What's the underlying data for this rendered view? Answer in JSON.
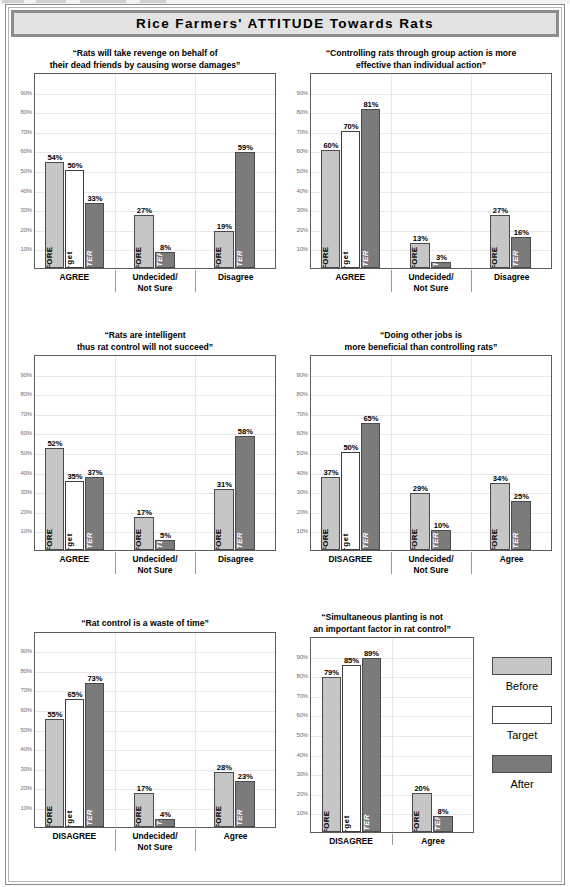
{
  "banner": {
    "title": "Rice Farmers' ATTITUDE Towards Rats"
  },
  "legend": {
    "items": [
      {
        "key": "before",
        "label": "Before",
        "color": "#c6c6c6"
      },
      {
        "key": "target",
        "label": "Target",
        "color": "#ffffff"
      },
      {
        "key": "after",
        "label": "After",
        "color": "#7b7b7b"
      }
    ]
  },
  "axis": {
    "ticks": [
      "90%",
      "80%",
      "70%",
      "60%",
      "50%",
      "40%",
      "30%",
      "20%",
      "10%"
    ],
    "ylim": [
      0,
      100
    ]
  },
  "series_inner_labels": {
    "before": "BEFORE",
    "target": "target",
    "after": "AFTER"
  },
  "chart_data": [
    {
      "id": "chart-1",
      "type": "bar",
      "title": "“Rats will take revenge on behalf of\nthier dead friends by causing worse damages”",
      "title_lines": [
        "“Rats will take revenge on behalf of",
        "their dead friends by causing worse damages”"
      ],
      "categories": [
        "AGREE",
        "Undecided/\nNot Sure",
        "Disagree"
      ],
      "category_lines": [
        [
          "AGREE"
        ],
        [
          "Undecided/",
          "Not Sure"
        ],
        [
          "Disagree"
        ]
      ],
      "series": [
        {
          "name": "Before",
          "values": [
            54,
            27,
            19
          ]
        },
        {
          "name": "Target",
          "values": [
            50,
            null,
            null
          ]
        },
        {
          "name": "After",
          "values": [
            33,
            8,
            59
          ]
        }
      ],
      "ylabel": "",
      "xlabel": "",
      "ylim": [
        0,
        100
      ],
      "grid": true,
      "legend_position": "external-right"
    },
    {
      "id": "chart-2",
      "type": "bar",
      "title_lines": [
        "“Controlling rats through group action is more",
        "effective than individual action”"
      ],
      "categories": [
        "AGREE",
        "Undecided/\nNot Sure",
        "Disagree"
      ],
      "category_lines": [
        [
          "AGREE"
        ],
        [
          "Undecided/",
          "Not Sure"
        ],
        [
          "Disagree"
        ]
      ],
      "series": [
        {
          "name": "Before",
          "values": [
            60,
            13,
            27
          ]
        },
        {
          "name": "Target",
          "values": [
            70,
            null,
            null
          ]
        },
        {
          "name": "After",
          "values": [
            81,
            3,
            16
          ]
        }
      ],
      "ylabel": "",
      "xlabel": "",
      "ylim": [
        0,
        100
      ],
      "grid": true,
      "legend_position": "external-right"
    },
    {
      "id": "chart-3",
      "type": "bar",
      "title_lines": [
        "“Rats are intelligent",
        "thus rat control will not succeed”"
      ],
      "categories": [
        "AGREE",
        "Undecided/\nNot Sure",
        "Disagree"
      ],
      "category_lines": [
        [
          "AGREE"
        ],
        [
          "Undecided/",
          "Not Sure"
        ],
        [
          "Disagree"
        ]
      ],
      "series": [
        {
          "name": "Before",
          "values": [
            52,
            17,
            31
          ]
        },
        {
          "name": "Target",
          "values": [
            35,
            null,
            null
          ]
        },
        {
          "name": "After",
          "values": [
            37,
            5,
            58
          ]
        }
      ],
      "ylabel": "",
      "xlabel": "",
      "ylim": [
        0,
        100
      ],
      "grid": true,
      "legend_position": "external-right"
    },
    {
      "id": "chart-4",
      "type": "bar",
      "title_lines": [
        "“Doing other jobs is",
        "more beneficial than controlling rats”"
      ],
      "categories": [
        "DISAGREE",
        "Undecided/\nNot Sure",
        "Agree"
      ],
      "category_lines": [
        [
          "DISAGREE"
        ],
        [
          "Undecided/",
          "Not Sure"
        ],
        [
          "Agree"
        ]
      ],
      "series": [
        {
          "name": "Before",
          "values": [
            37,
            29,
            34
          ]
        },
        {
          "name": "Target",
          "values": [
            50,
            null,
            null
          ]
        },
        {
          "name": "After",
          "values": [
            65,
            10,
            25
          ]
        }
      ],
      "ylabel": "",
      "xlabel": "",
      "ylim": [
        0,
        100
      ],
      "grid": true,
      "legend_position": "external-right"
    },
    {
      "id": "chart-5",
      "type": "bar",
      "title_lines": [
        "“Rat control is a waste of time”"
      ],
      "categories": [
        "DISAGREE",
        "Undecided/\nNot Sure",
        "Agree"
      ],
      "category_lines": [
        [
          "DISAGREE"
        ],
        [
          "Undecided/",
          "Not Sure"
        ],
        [
          "Agree"
        ]
      ],
      "series": [
        {
          "name": "Before",
          "values": [
            55,
            17,
            28
          ]
        },
        {
          "name": "Target",
          "values": [
            65,
            null,
            null
          ]
        },
        {
          "name": "After",
          "values": [
            73,
            4,
            23
          ]
        }
      ],
      "ylabel": "",
      "xlabel": "",
      "ylim": [
        0,
        100
      ],
      "grid": true,
      "legend_position": "external-right"
    },
    {
      "id": "chart-6",
      "type": "bar",
      "title_lines": [
        "“Simultaneous planting is not",
        "an important factor in rat control”"
      ],
      "categories": [
        "DISAGREE",
        "Agree"
      ],
      "category_lines": [
        [
          "DISAGREE"
        ],
        [
          "Agree"
        ]
      ],
      "series": [
        {
          "name": "Before",
          "values": [
            79,
            20
          ]
        },
        {
          "name": "Target",
          "values": [
            85,
            null
          ]
        },
        {
          "name": "After",
          "values": [
            89,
            8
          ]
        }
      ],
      "ylabel": "",
      "xlabel": "",
      "ylim": [
        0,
        100
      ],
      "grid": true,
      "legend_position": "external-right"
    }
  ],
  "layout": {
    "panels": [
      {
        "id": "chart-1",
        "left": 14,
        "top": 48,
        "width": 262,
        "height": 248,
        "plotH": 196
      },
      {
        "id": "chart-2",
        "left": 290,
        "top": 48,
        "width": 262,
        "height": 248,
        "plotH": 196
      },
      {
        "id": "chart-3",
        "left": 14,
        "top": 330,
        "width": 262,
        "height": 248,
        "plotH": 196
      },
      {
        "id": "chart-4",
        "left": 290,
        "top": 330,
        "width": 262,
        "height": 248,
        "plotH": 196
      },
      {
        "id": "chart-5",
        "left": 14,
        "top": 618,
        "width": 262,
        "height": 248,
        "plotH": 196
      },
      {
        "id": "chart-6",
        "left": 290,
        "top": 612,
        "width": 184,
        "height": 254,
        "plotH": 196
      }
    ],
    "legend_box": {
      "left": 483,
      "top": 657,
      "width": 78
    }
  }
}
